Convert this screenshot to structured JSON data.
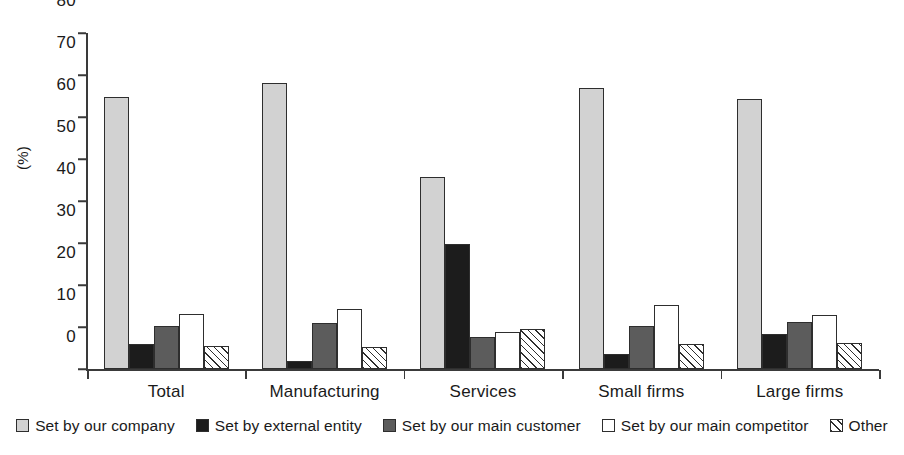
{
  "chart_data": {
    "type": "bar",
    "title": "",
    "xlabel": "",
    "ylabel": "(%)",
    "ylim": [
      0,
      80
    ],
    "ytick_step": 10,
    "yticks": [
      0,
      10,
      20,
      30,
      40,
      50,
      60,
      70,
      80
    ],
    "grid": false,
    "legend_position": "bottom",
    "categories": [
      "Total",
      "Manufacturing",
      "Services",
      "Small firms",
      "Large firms"
    ],
    "series": [
      {
        "name": "Set by our company",
        "key": "company",
        "color": "#d2d2d2",
        "pattern": "solid",
        "values": [
          64.8,
          68.2,
          45.6,
          67.0,
          64.3
        ]
      },
      {
        "name": "Set by external entity",
        "key": "external",
        "color": "#1c1c1c",
        "pattern": "solid",
        "values": [
          5.9,
          2.0,
          29.8,
          3.5,
          8.3
        ]
      },
      {
        "name": "Set by our main customer",
        "key": "customer",
        "color": "#5c5c5c",
        "pattern": "solid",
        "values": [
          10.2,
          11.0,
          7.6,
          10.3,
          11.3
        ]
      },
      {
        "name": "Set by our main competitor",
        "key": "competitor",
        "color": "#ffffff",
        "pattern": "solid",
        "values": [
          13.2,
          14.2,
          8.8,
          15.2,
          12.8
        ]
      },
      {
        "name": "Other",
        "key": "other",
        "color": "#ffffff",
        "pattern": "diagonal-hatch",
        "values": [
          5.5,
          5.3,
          9.6,
          6.0,
          6.2
        ]
      }
    ]
  }
}
